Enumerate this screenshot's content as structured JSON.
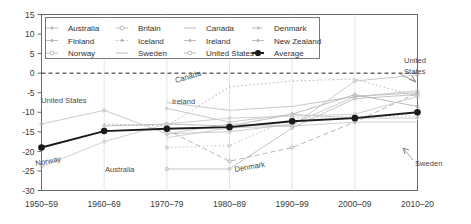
{
  "chart_data": {
    "type": "line",
    "title": "",
    "subtitle": "",
    "xlabel": "",
    "ylabel": "",
    "ylim": [
      -30,
      15
    ],
    "xlim": [
      0,
      6
    ],
    "grid": "vertical-light",
    "zero_line": true,
    "legend_position": "top-inside",
    "categories": [
      "1950–59",
      "1960–69",
      "1970–79",
      "1980–89",
      "1990–99",
      "2000–09",
      "2010–20"
    ],
    "yticks": [
      15,
      10,
      5,
      0,
      -5,
      -10,
      -15,
      -20,
      -25,
      -30
    ],
    "series": [
      {
        "name": "Australia",
        "values": [
          null,
          null,
          -24.5,
          -24.5,
          -14.0,
          -6.5,
          -5.5
        ],
        "color": "#b9b9b9",
        "style": "solid-marker"
      },
      {
        "name": "Britain",
        "values": [
          null,
          null,
          -15.5,
          -15.0,
          -13.0,
          -6.0,
          -4.5
        ],
        "color": "#c3c3c3",
        "style": "solid-open"
      },
      {
        "name": "Canada",
        "values": [
          null,
          null,
          -7.5,
          -9.5,
          -8.5,
          -6.0,
          -5.0
        ],
        "color": "#bdbdbd",
        "style": "solid"
      },
      {
        "name": "Denmark",
        "values": [
          null,
          null,
          -14.5,
          -22.5,
          -19.0,
          -12.5,
          -5.0
        ],
        "color": "#a8a8a8",
        "style": "dashed-marker"
      },
      {
        "name": "Finland",
        "values": [
          null,
          -13.5,
          -13.0,
          -13.5,
          -10.5,
          -5.5,
          -8.5
        ],
        "color": "#b0b0b0",
        "style": "solid-marker"
      },
      {
        "name": "Iceland",
        "values": [
          null,
          -13.0,
          -13.5,
          -3.5,
          -2.0,
          -1.5,
          -6.0
        ],
        "color": "#aaaaaa",
        "style": "dotted"
      },
      {
        "name": "Ireland",
        "values": [
          null,
          null,
          -9.0,
          -12.5,
          -10.5,
          -11.5,
          -11.5
        ],
        "color": "#c0c0c0",
        "style": "solid-cross"
      },
      {
        "name": "New Zealand",
        "values": [
          null,
          null,
          -19.0,
          -18.5,
          -11.5,
          -11.0,
          -11.0
        ],
        "color": "#bebebe",
        "style": "dotted-marker"
      },
      {
        "name": "Norway",
        "values": [
          -24.0,
          -17.5,
          -13.0,
          -11.5,
          -11.0,
          -10.5,
          -6.0
        ],
        "color": "#c8c8c8",
        "style": "solid-open"
      },
      {
        "name": "Sweden",
        "values": [
          null,
          null,
          -16.5,
          -14.0,
          -13.5,
          -12.5,
          -12.5
        ],
        "color": "#c6c6c6",
        "style": "solid"
      },
      {
        "name": "United States",
        "values": [
          -13.0,
          -9.5,
          -15.5,
          -13.0,
          -13.5,
          -2.0,
          -0.5
        ],
        "color": "#c2c2c2",
        "style": "solid-open"
      },
      {
        "name": "Average",
        "values": [
          -19.0,
          -14.8,
          -14.2,
          -13.8,
          -12.3,
          -11.5,
          -10.0
        ],
        "color": "#1a1a1a",
        "style": "bold-dot"
      }
    ]
  },
  "legend": {
    "entries": [
      {
        "label": "Australia",
        "marker": "line-dot"
      },
      {
        "label": "Britain",
        "marker": "line-open-circle"
      },
      {
        "label": "Canada",
        "marker": "line-plain"
      },
      {
        "label": "Denmark",
        "marker": "line-dash-dot"
      },
      {
        "label": "Finland",
        "marker": "line-star"
      },
      {
        "label": "Iceland",
        "marker": "line-dotted"
      },
      {
        "label": "Ireland",
        "marker": "line-cross"
      },
      {
        "label": "New Zealand",
        "marker": "line-dot-small"
      },
      {
        "label": "Norway",
        "marker": "line-open-diamond"
      },
      {
        "label": "Sweden",
        "marker": "line-plain"
      },
      {
        "label": "United States",
        "marker": "line-open-circle"
      },
      {
        "label": "Average",
        "marker": "bold-filled-circle"
      }
    ]
  },
  "annotations": [
    {
      "name": "annotation-united-states-left",
      "text": "United States"
    },
    {
      "name": "annotation-norway",
      "text": "Norway"
    },
    {
      "name": "annotation-australia",
      "text": "Australia"
    },
    {
      "name": "annotation-canada",
      "text": "Canada"
    },
    {
      "name": "annotation-ireland",
      "text": "Ireland"
    },
    {
      "name": "annotation-denmark",
      "text": "Denmark"
    },
    {
      "name": "annotation-united-states-right-line1",
      "text": "United"
    },
    {
      "name": "annotation-united-states-right-line2",
      "text": "States"
    },
    {
      "name": "annotation-sweden",
      "text": "Sweden"
    }
  ],
  "axes": {
    "y_labels": [
      "15",
      "10",
      "5",
      "0",
      "-5",
      "-10",
      "-15",
      "-20",
      "-25",
      "-30"
    ],
    "x_labels": [
      "1950–59",
      "1960–69",
      "1970–79",
      "1980–89",
      "1990–99",
      "2000–09",
      "2010–20"
    ]
  },
  "colors": {
    "average": "#1a1a1a",
    "series_grey": "#bfbfbf",
    "axis": "#555555",
    "text": "#3a3a3a"
  }
}
